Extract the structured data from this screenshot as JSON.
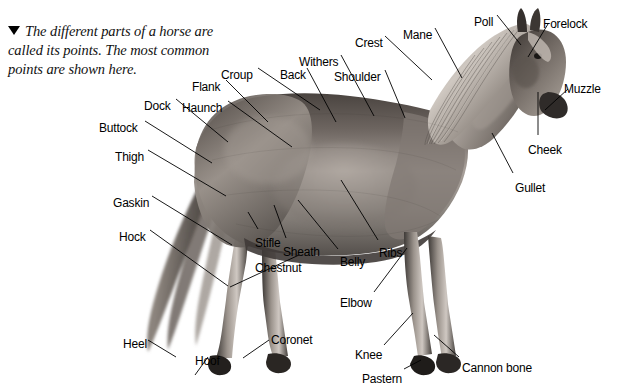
{
  "caption": {
    "marker": "triangle-down",
    "text": "The different parts of a horse are called its points. The most common points are shown here."
  },
  "diagram": {
    "subject": "horse",
    "labels": [
      {
        "id": "flank",
        "text": "Flank",
        "x": 192,
        "y": 80,
        "lx": 226,
        "ly": 80,
        "tx": 268,
        "ty": 122
      },
      {
        "id": "croup",
        "text": "Croup",
        "x": 221,
        "y": 68,
        "lx": 258,
        "ly": 68,
        "tx": 320,
        "ty": 110
      },
      {
        "id": "dock",
        "text": "Dock",
        "x": 144,
        "y": 99,
        "lx": 176,
        "ly": 99,
        "tx": 228,
        "ty": 142
      },
      {
        "id": "haunch",
        "text": "Haunch",
        "x": 182,
        "y": 101,
        "lx": 228,
        "ly": 101,
        "tx": 292,
        "ty": 147
      },
      {
        "id": "back",
        "text": "Back",
        "x": 280,
        "y": 68,
        "lx": 307,
        "ly": 68,
        "tx": 336,
        "ty": 122
      },
      {
        "id": "withers",
        "text": "Withers",
        "x": 299,
        "y": 55,
        "lx": 341,
        "ly": 55,
        "tx": 374,
        "ty": 116
      },
      {
        "id": "shoulder",
        "text": "Shoulder",
        "x": 334,
        "y": 70,
        "lx": 385,
        "ly": 70,
        "tx": 405,
        "ty": 118
      },
      {
        "id": "crest",
        "text": "Crest",
        "x": 355,
        "y": 36,
        "lx": 385,
        "ly": 36,
        "tx": 432,
        "ty": 80
      },
      {
        "id": "mane",
        "text": "Mane",
        "x": 403,
        "y": 28,
        "lx": 435,
        "ly": 28,
        "tx": 462,
        "ty": 78
      },
      {
        "id": "poll",
        "text": "Poll",
        "x": 474,
        "y": 15,
        "lx": 497,
        "ly": 15,
        "tx": 521,
        "ty": 45
      },
      {
        "id": "forelock",
        "text": "Forelock",
        "x": 543,
        "y": 17,
        "lx": 548,
        "ly": 24,
        "tx": 528,
        "ty": 57
      },
      {
        "id": "muzzle",
        "text": "Muzzle",
        "x": 564,
        "y": 82,
        "lx": 568,
        "ly": 89,
        "tx": 545,
        "ty": 110
      },
      {
        "id": "cheek",
        "text": "Cheek",
        "x": 528,
        "y": 143,
        "lx": 538,
        "ly": 135,
        "tx": 538,
        "ty": 92
      },
      {
        "id": "gullet",
        "text": "Gullet",
        "x": 515,
        "y": 181,
        "lx": 513,
        "ly": 173,
        "tx": 492,
        "ty": 133
      },
      {
        "id": "buttock",
        "text": "Buttock",
        "x": 99,
        "y": 121,
        "lx": 145,
        "ly": 121,
        "tx": 212,
        "ty": 163
      },
      {
        "id": "thigh",
        "text": "Thigh",
        "x": 115,
        "y": 150,
        "lx": 148,
        "ly": 150,
        "tx": 226,
        "ty": 196
      },
      {
        "id": "gaskin",
        "text": "Gaskin",
        "x": 113,
        "y": 196,
        "lx": 152,
        "ly": 196,
        "tx": 232,
        "ty": 245
      },
      {
        "id": "hock",
        "text": "Hock",
        "x": 119,
        "y": 230,
        "lx": 150,
        "ly": 230,
        "tx": 228,
        "ty": 286
      },
      {
        "id": "stifle",
        "text": "Stifle",
        "x": 255,
        "y": 236,
        "lx": 258,
        "ly": 229,
        "tx": 248,
        "ty": 212
      },
      {
        "id": "sheath",
        "text": "Sheath",
        "x": 283,
        "y": 245,
        "lx": 286,
        "ly": 238,
        "tx": 274,
        "ty": 205
      },
      {
        "id": "chestnut",
        "text": "Chestnut",
        "x": 255,
        "y": 261,
        "lx": 299,
        "ly": 255,
        "tx": 230,
        "ty": 287
      },
      {
        "id": "belly",
        "text": "Belly",
        "x": 340,
        "y": 255,
        "lx": 338,
        "ly": 249,
        "tx": 298,
        "ty": 200
      },
      {
        "id": "ribs",
        "text": "Ribs",
        "x": 379,
        "y": 246,
        "lx": 378,
        "ly": 240,
        "tx": 341,
        "ty": 180
      },
      {
        "id": "elbow",
        "text": "Elbow",
        "x": 340,
        "y": 296,
        "lx": 374,
        "ly": 292,
        "tx": 407,
        "ty": 248
      },
      {
        "id": "knee",
        "text": "Knee",
        "x": 355,
        "y": 348,
        "lx": 384,
        "ly": 345,
        "tx": 413,
        "ty": 313
      },
      {
        "id": "pastern",
        "text": "Pastern",
        "x": 362,
        "y": 372,
        "lx": 404,
        "ly": 369,
        "tx": 421,
        "ty": 360
      },
      {
        "id": "cannon-bone",
        "text": "Cannon bone",
        "x": 462,
        "y": 361,
        "lx": 459,
        "ly": 357,
        "tx": 434,
        "ty": 335
      },
      {
        "id": "coronet",
        "text": "Coronet",
        "x": 271,
        "y": 333,
        "lx": 269,
        "ly": 340,
        "tx": 243,
        "ty": 358
      },
      {
        "id": "heel",
        "text": "Heel",
        "x": 123,
        "y": 337,
        "lx": 148,
        "ly": 340,
        "tx": 176,
        "ty": 357
      },
      {
        "id": "hoof",
        "text": "Hoof",
        "x": 195,
        "y": 354,
        "lx": 208,
        "ly": 357,
        "tx": 195,
        "ty": 375
      }
    ]
  }
}
